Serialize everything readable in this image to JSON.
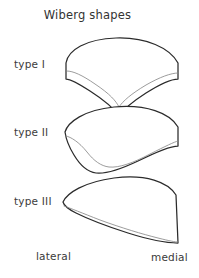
{
  "figure": {
    "title": "Wiberg shapes",
    "orientation": {
      "left_label": "lateral",
      "right_label": "medial"
    },
    "rows": [
      {
        "label": "type I"
      },
      {
        "label": "type II"
      },
      {
        "label": "type III"
      }
    ],
    "colors": {
      "background": "#ffffff",
      "outline": "#2b2b2b",
      "inner_line": "#8a8a8a",
      "text": "#3a3a3a"
    }
  },
  "chart_data": {
    "type": "diagram",
    "title": "Wiberg shapes",
    "subtitle": "",
    "xlabel": "",
    "ylabel": "",
    "annotations": [
      "lateral",
      "medial"
    ],
    "categories": [
      "type I",
      "type II",
      "type III"
    ],
    "items": [
      {
        "name": "type I",
        "label": "type I",
        "outline_path": "M 66 63 C 68 50 86 39 116 38 C 146 37 170 48 178 63 L 178 79 C 171 79 160 84 146 93 C 132 102 123 110 119 116 C 115 110 104 100 90 91 C 78 83 70 79 66 79 Z",
        "inner_path": "M 67 71 C 73 71 82 75 95 84 C 110 94 116 101 119 107 C 123 101 131 94 146 85 C 160 77 171 73 178 73",
        "symmetry": "symmetric, deep central V notch on the underside"
      },
      {
        "name": "type II",
        "label": "type II",
        "outline_path": "M 65 132 C 68 122 84 110 114 107 C 146 104 170 113 178 127 L 178 146 C 170 146 156 152 138 161 C 119 170 105 174 96 173 C 88 172 80 165 74 155 C 69 147 66 139 65 132 Z",
        "inner_path": "M 66 136 C 71 137 79 142 87 152 C 94 161 101 166 109 167 C 119 168 133 163 150 154 C 166 146 174 142 178 141",
        "symmetry": "asymmetric, smaller lateral facet, underside sweeps down to the right"
      },
      {
        "name": "type III",
        "label": "type III",
        "outline_path": "M 63 202 C 67 193 84 182 114 178 C 146 174 168 182 176 195 L 178 243 C 168 243 150 240 128 233 C 106 226 88 219 76 213 C 68 209 64 206 63 202 Z",
        "inner_path": "M 64 206 C 70 208 82 213 100 220 C 122 228 142 234 158 238 C 170 241 175 242 178 242",
        "symmetry": "markedly asymmetric, very small lateral facet, long medial facet sloping down to the right"
      }
    ]
  }
}
